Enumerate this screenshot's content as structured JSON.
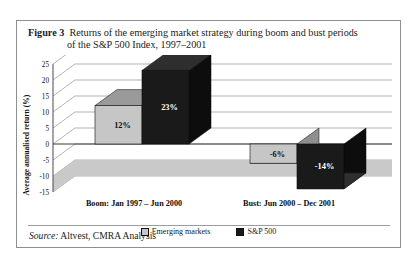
{
  "figure": {
    "label": "Figure 3",
    "caption_line1": "Returns of the emerging market strategy during boom and bust periods",
    "caption_line2": "of the S&P 500 Index, 1997–2001",
    "source_word": "Source:",
    "source_text": " Altvest, CMRA Analysis"
  },
  "colors": {
    "emerging_markets": "#c6c6c6",
    "emerging_markets_top": "#9a9a9a",
    "emerging_markets_side": "#8f8f8f",
    "sp500": "#1a1a1a",
    "sp500_top": "#2e2e2e",
    "sp500_side": "#0d0d0d",
    "floor": "#c9c9c9",
    "gridline": "#8e9095",
    "axis": "#4a4a4a",
    "frame": "#8d8f93"
  },
  "chart_data": {
    "type": "bar",
    "title": "Returns of the emerging market strategy during boom and bust periods of the S&P 500 Index, 1997–2001",
    "xlabel": "",
    "ylabel": "Average annualised return (%)",
    "ylim": [
      -15,
      25
    ],
    "yticks": [
      25,
      20,
      15,
      10,
      5,
      0,
      -5,
      -10,
      -15
    ],
    "ytick_labels": [
      "25",
      "20",
      "15",
      "10",
      "5",
      "0",
      "-5",
      "-10",
      "-15"
    ],
    "grid": true,
    "legend_position": "bottom",
    "categories": [
      "Boom: Jan  1997 – Jun  2000",
      "Bust: Jun  2000 – Dec 2001"
    ],
    "series": [
      {
        "name": "Emerging markets",
        "values": [
          12,
          -6
        ],
        "labels": [
          "12%",
          "-6%"
        ],
        "label_color": "#111111"
      },
      {
        "name": "S&P 500",
        "values": [
          23,
          -14
        ],
        "labels": [
          "23%",
          "-14%"
        ],
        "label_color": "#ffffff"
      }
    ]
  }
}
